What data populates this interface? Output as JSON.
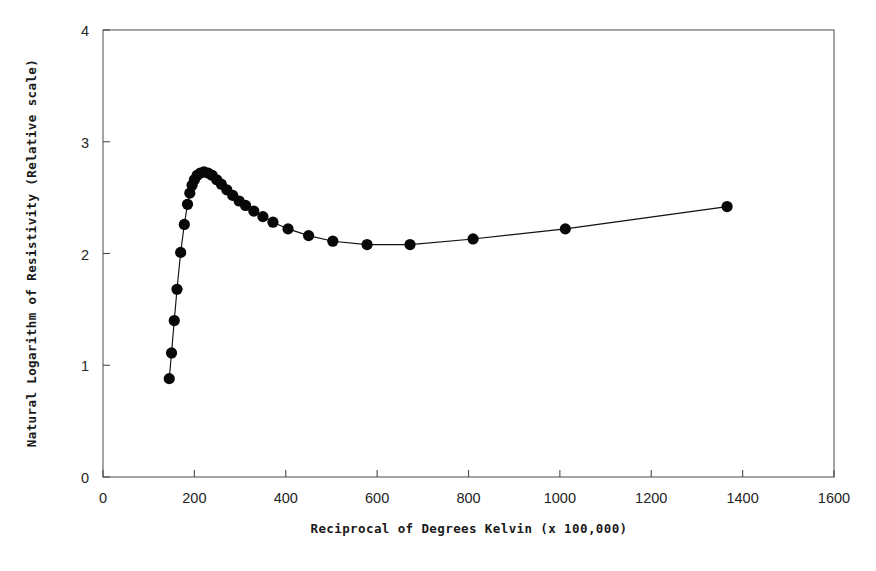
{
  "chart_data": {
    "type": "line",
    "title": "",
    "xlabel": "Reciprocal of Degrees Kelvin (x 100,000)",
    "ylabel": "Natural Logarithm of Resistivity (Relative scale)",
    "xlim": [
      0,
      1600
    ],
    "ylim": [
      0,
      4
    ],
    "xticks": [
      0,
      200,
      400,
      600,
      800,
      1000,
      1200,
      1400,
      1600
    ],
    "yticks": [
      0,
      1,
      2,
      3,
      4
    ],
    "xtick_labels": [
      "0",
      "200",
      "400",
      "600",
      "800",
      "1000",
      "1200",
      "1400",
      "1600"
    ],
    "ytick_labels": [
      "0",
      "1",
      "2",
      "3",
      "4"
    ],
    "grid": false,
    "legend": false,
    "marker": "filled-circle",
    "marker_color": "#080808",
    "line_color": "#111111",
    "background": "#ffffff",
    "frame_color": "#5a5a5a",
    "series": [
      {
        "name": "resistivity",
        "points": [
          [
            145,
            0.88
          ],
          [
            150,
            1.11
          ],
          [
            156,
            1.4
          ],
          [
            162,
            1.68
          ],
          [
            170,
            2.01
          ],
          [
            178,
            2.26
          ],
          [
            185,
            2.44
          ],
          [
            190,
            2.54
          ],
          [
            195,
            2.61
          ],
          [
            200,
            2.66
          ],
          [
            206,
            2.7
          ],
          [
            213,
            2.72
          ],
          [
            221,
            2.73
          ],
          [
            230,
            2.72
          ],
          [
            239,
            2.7
          ],
          [
            249,
            2.66
          ],
          [
            259,
            2.62
          ],
          [
            271,
            2.57
          ],
          [
            284,
            2.52
          ],
          [
            298,
            2.47
          ],
          [
            312,
            2.43
          ],
          [
            330,
            2.38
          ],
          [
            350,
            2.33
          ],
          [
            372,
            2.28
          ],
          [
            405,
            2.22
          ],
          [
            450,
            2.16
          ],
          [
            503,
            2.11
          ],
          [
            578,
            2.08
          ],
          [
            672,
            2.08
          ],
          [
            810,
            2.13
          ],
          [
            1012,
            2.22
          ],
          [
            1366,
            2.42
          ]
        ]
      }
    ]
  }
}
